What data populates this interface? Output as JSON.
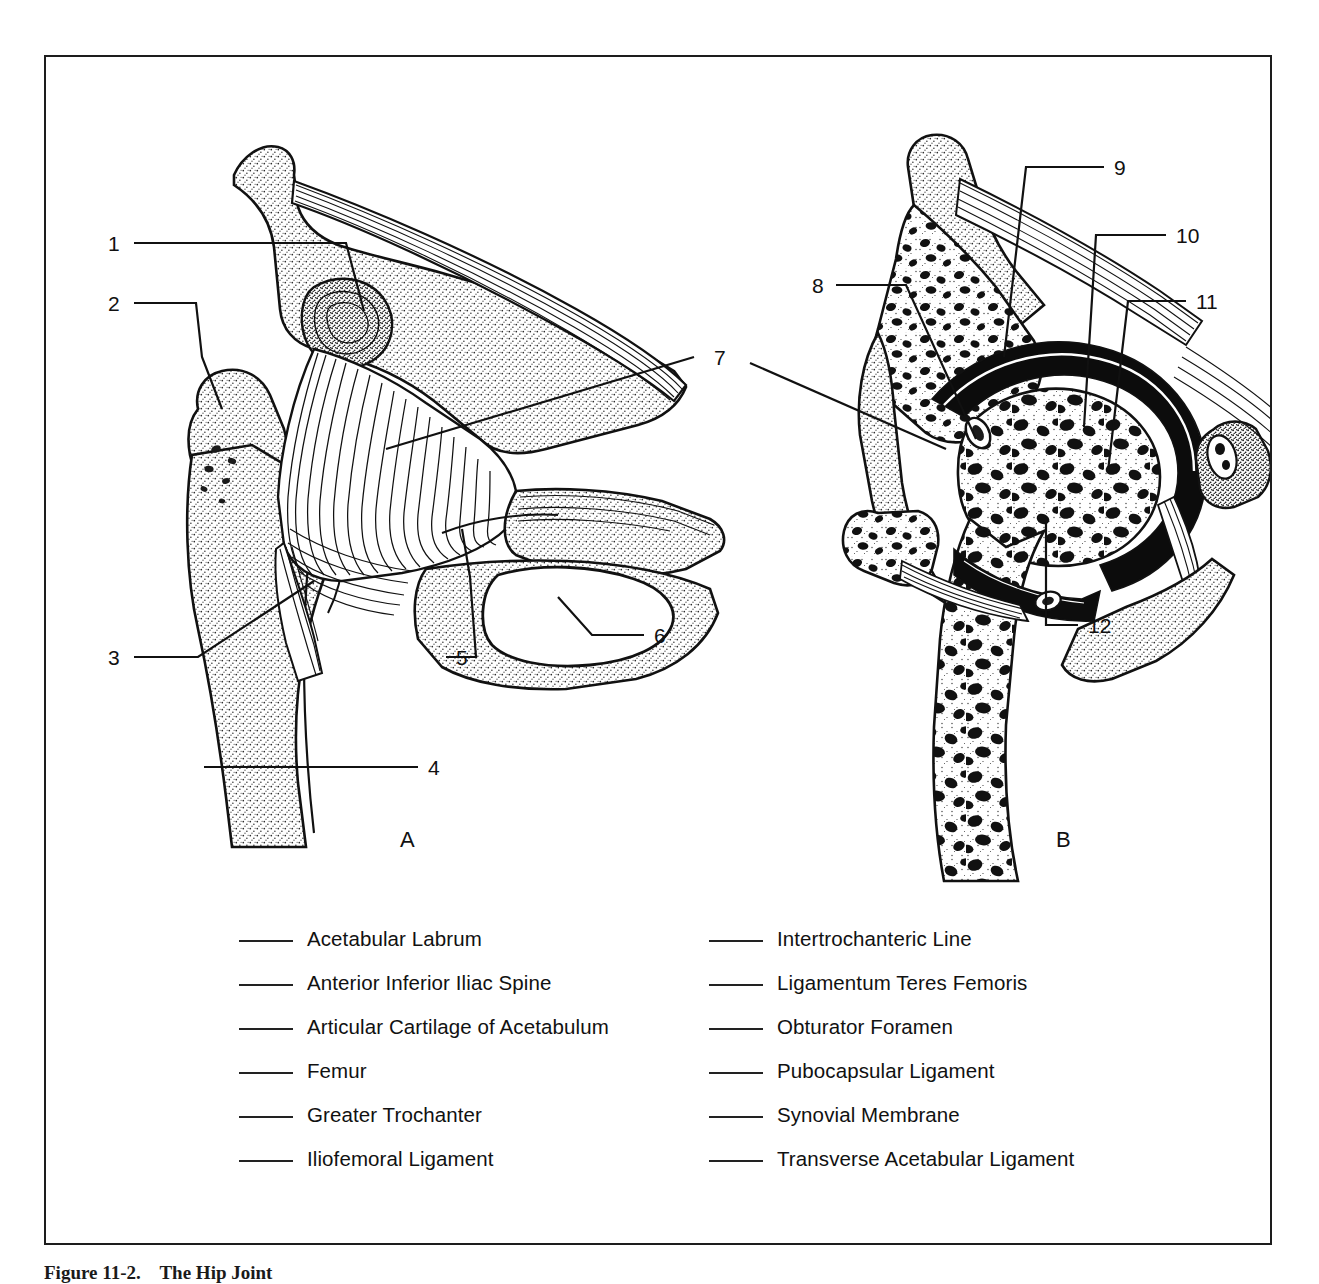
{
  "figure": {
    "caption_number": "Figure 11-2.",
    "caption_title": "The Hip Joint",
    "subfigures": [
      {
        "letter": "A",
        "description": "anterior view of hip joint with iliofemoral ligament"
      },
      {
        "letter": "B",
        "description": "coronal section of hip joint"
      }
    ]
  },
  "callouts": [
    {
      "number": "1",
      "panel": "A"
    },
    {
      "number": "2",
      "panel": "A"
    },
    {
      "number": "3",
      "panel": "A"
    },
    {
      "number": "4",
      "panel": "A"
    },
    {
      "number": "5",
      "panel": "A"
    },
    {
      "number": "6",
      "panel": "A"
    },
    {
      "number": "7",
      "panel": "AB"
    },
    {
      "number": "8",
      "panel": "B"
    },
    {
      "number": "9",
      "panel": "B"
    },
    {
      "number": "10",
      "panel": "B"
    },
    {
      "number": "11",
      "panel": "B"
    },
    {
      "number": "12",
      "panel": "B"
    }
  ],
  "answer_list": {
    "left_column": [
      {
        "blank": "",
        "label": "Acetabular Labrum"
      },
      {
        "blank": "",
        "label": "Anterior Inferior Iliac Spine"
      },
      {
        "blank": "",
        "label": "Articular Cartilage of Acetabulum"
      },
      {
        "blank": "",
        "label": "Femur"
      },
      {
        "blank": "",
        "label": "Greater Trochanter"
      },
      {
        "blank": "",
        "label": "Iliofemoral Ligament"
      }
    ],
    "right_column": [
      {
        "blank": "",
        "label": "Intertrochanteric Line"
      },
      {
        "blank": "",
        "label": "Ligamentum Teres Femoris"
      },
      {
        "blank": "",
        "label": "Obturator Foramen"
      },
      {
        "blank": "",
        "label": "Pubocapsular Ligament"
      },
      {
        "blank": "",
        "label": "Synovial Membrane"
      },
      {
        "blank": "",
        "label": "Transverse Acetabular Ligament"
      }
    ]
  },
  "colors": {
    "ink": "#111111",
    "frame": "#1d1d1d",
    "paper": "#ffffff",
    "stipple": "#2b2b2b"
  }
}
